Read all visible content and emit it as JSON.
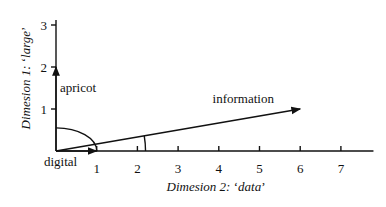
{
  "chart_data": {
    "type": "vector-diagram",
    "xlabel": {
      "prefix": "Dimesion 2: ",
      "quoted": "data"
    },
    "ylabel": {
      "prefix": "Dimesion 1: ",
      "quoted": "large"
    },
    "x_ticks": [
      "1",
      "2",
      "3",
      "4",
      "5",
      "6",
      "7"
    ],
    "y_ticks": [
      "1",
      "2",
      "3"
    ],
    "xlim": [
      0,
      7.8
    ],
    "ylim": [
      0,
      3
    ],
    "vectors": [
      {
        "name": "apricot",
        "label": "apricot",
        "x": 0,
        "y": 2
      },
      {
        "name": "digital",
        "label": "digital",
        "x": 1,
        "y": 0
      },
      {
        "name": "information",
        "label": "information",
        "x": 6,
        "y": 1
      }
    ],
    "angles": [
      {
        "between": [
          "apricot",
          "digital"
        ],
        "arc_radius_units": 1
      },
      {
        "between": [
          "information",
          "digital"
        ],
        "arc_radius_units": 2.2
      }
    ]
  }
}
